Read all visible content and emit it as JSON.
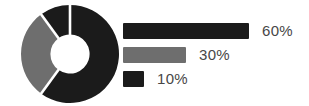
{
  "chart_data": {
    "type": "pie",
    "subtype": "donut",
    "title": "",
    "values": [
      60,
      30,
      10
    ],
    "labels": [
      "60%",
      "30%",
      "10%"
    ],
    "colors": [
      "#1b1b1b",
      "#6e6e6e",
      "#1b1b1b"
    ],
    "start_angle_deg": 0,
    "clockwise": true,
    "donut_hole_ratio": 0.4,
    "separator_color": "#ffffff",
    "background": "#ffffff",
    "text_color": "#474747",
    "legend_position": "right",
    "legend_style": "proportional-bars",
    "legend": [
      {
        "label": "60%",
        "value": 60,
        "color": "#1b1b1b"
      },
      {
        "label": "30%",
        "value": 30,
        "color": "#6e6e6e"
      },
      {
        "label": "10%",
        "value": 10,
        "color": "#1b1b1b"
      }
    ]
  }
}
